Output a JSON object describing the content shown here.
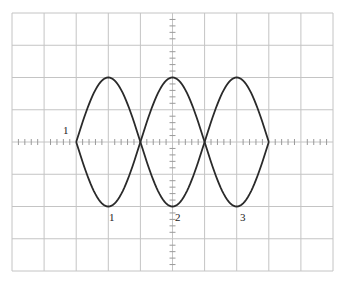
{
  "chart_data": {
    "type": "line",
    "title": "",
    "grid": {
      "cols": 10,
      "rows": 8,
      "minor_ticks_per_division": 5
    },
    "xlabel": "",
    "ylabel": "",
    "xlim": [
      -5,
      5
    ],
    "ylim": [
      -4,
      4
    ],
    "series": [
      {
        "name": "upper trace",
        "x": [
          -3,
          -2,
          -1,
          0,
          1,
          2,
          3
        ],
        "values": [
          0,
          2,
          0,
          2,
          0,
          2,
          0
        ]
      },
      {
        "name": "lower trace",
        "x": [
          -3,
          -2,
          -1,
          0,
          1,
          2,
          3
        ],
        "values": [
          0,
          -2,
          0,
          -2,
          0,
          -2,
          0
        ]
      }
    ],
    "lobes": [
      {
        "x_from": -3,
        "x_to": -1,
        "amplitude": 2
      },
      {
        "x_from": -1,
        "x_to": 1,
        "amplitude": 2
      },
      {
        "x_from": 1,
        "x_to": 3,
        "amplitude": 2
      }
    ],
    "annotations": [
      {
        "text": "1",
        "position": "left of trace at horizontal axis"
      },
      {
        "text": "1",
        "position": "below first lobe"
      },
      {
        "text": "2",
        "position": "below second lobe"
      },
      {
        "text": "3",
        "position": "below third lobe"
      }
    ]
  },
  "labels": {
    "left": "1",
    "lobe1": "1",
    "lobe2": "2",
    "lobe3": "3"
  },
  "colors": {
    "grid": "#c4c4c4",
    "trace": "#2a2a2a",
    "axis_ticks": "#9a9a9a"
  }
}
